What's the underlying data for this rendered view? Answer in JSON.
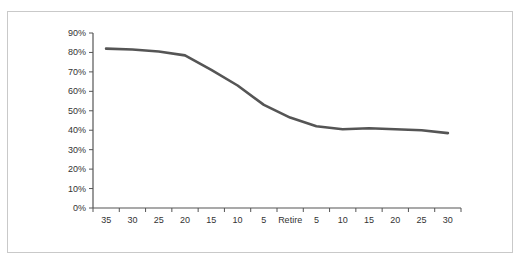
{
  "chart_data": {
    "type": "line",
    "title": "",
    "xlabel": "",
    "ylabel": "",
    "categories": [
      "35",
      "30",
      "25",
      "20",
      "15",
      "10",
      "5",
      "Retire",
      "5",
      "10",
      "15",
      "20",
      "25",
      "30"
    ],
    "series": [
      {
        "name": "",
        "color": "#555555",
        "values": [
          82,
          81.5,
          80.5,
          78.5,
          71,
          63,
          53,
          46.5,
          42,
          40.5,
          41,
          40.5,
          40,
          38.5
        ]
      }
    ],
    "y_ticks": [
      "0%",
      "10%",
      "20%",
      "30%",
      "40%",
      "50%",
      "60%",
      "70%",
      "80%",
      "90%"
    ],
    "ylim": [
      0,
      90
    ],
    "grid": false,
    "legend": "none"
  }
}
